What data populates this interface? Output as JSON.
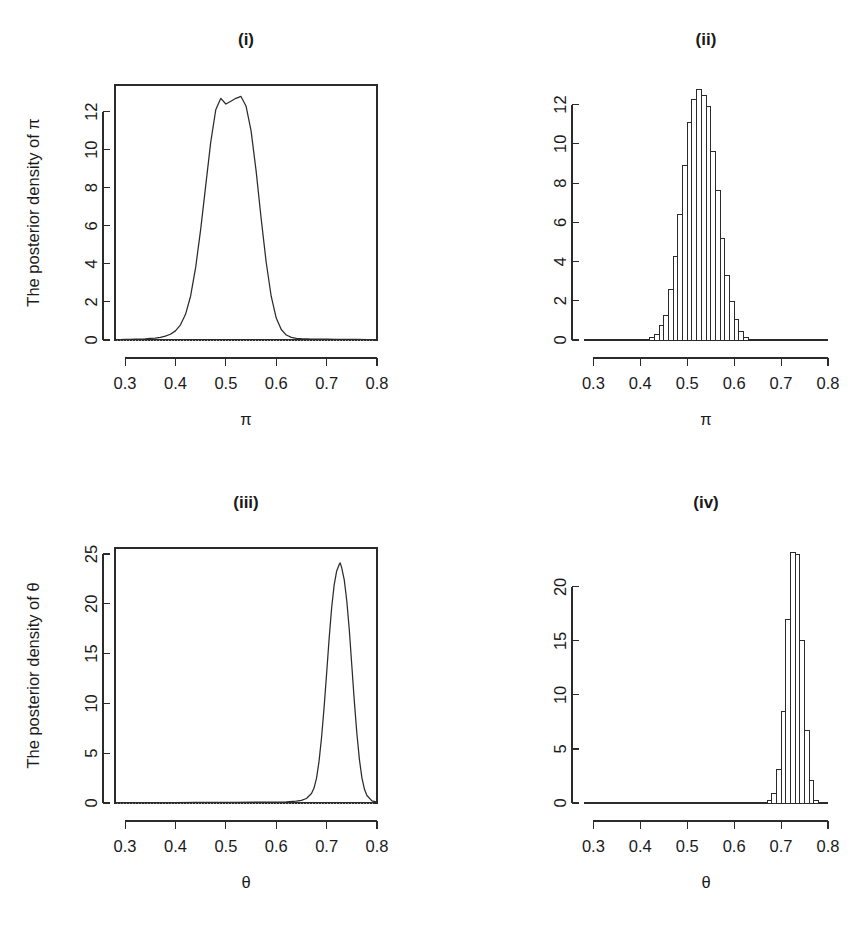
{
  "figure": {
    "width": 867,
    "height": 926,
    "background": "#ffffff",
    "ink_color": "#2b2b2b",
    "panel_count": 4
  },
  "chart_data": [
    {
      "id": "panel-i",
      "type": "line",
      "title": "(i)",
      "xlabel": "π",
      "ylabel": "The posterior density of  π",
      "xlim": [
        0.28,
        0.8
      ],
      "ylim": [
        0,
        13.4
      ],
      "xticks": [
        0.3,
        0.4,
        0.5,
        0.6,
        0.7,
        0.8
      ],
      "xtick_labels": [
        "0.3",
        "0.4",
        "0.5",
        "0.6",
        "0.7",
        "0.8"
      ],
      "yticks": [
        0,
        2,
        4,
        6,
        8,
        10,
        12
      ],
      "ytick_labels": [
        "0",
        "2",
        "4",
        "6",
        "8",
        "10",
        "12"
      ],
      "grid": false,
      "legend": null,
      "box": true,
      "zero_reference_line": true,
      "peak_x": 0.53,
      "peak_y": 12.8,
      "x": [
        0.28,
        0.29,
        0.3,
        0.31,
        0.32,
        0.33,
        0.34,
        0.35,
        0.36,
        0.37,
        0.38,
        0.39,
        0.4,
        0.41,
        0.42,
        0.43,
        0.44,
        0.45,
        0.46,
        0.47,
        0.48,
        0.49,
        0.5,
        0.51,
        0.52,
        0.53,
        0.54,
        0.55,
        0.56,
        0.57,
        0.58,
        0.59,
        0.6,
        0.61,
        0.62,
        0.63,
        0.64,
        0.65,
        0.66,
        0.67,
        0.68,
        0.69,
        0.7,
        0.72,
        0.74,
        0.76,
        0.78,
        0.8
      ],
      "y": [
        0.02,
        0.02,
        0.03,
        0.03,
        0.04,
        0.05,
        0.06,
        0.08,
        0.1,
        0.14,
        0.2,
        0.3,
        0.48,
        0.8,
        1.35,
        2.3,
        3.8,
        5.8,
        8.1,
        10.4,
        12.1,
        12.7,
        12.4,
        12.55,
        12.7,
        12.8,
        12.3,
        11.0,
        8.9,
        6.4,
        4.1,
        2.3,
        1.15,
        0.55,
        0.26,
        0.14,
        0.09,
        0.07,
        0.06,
        0.05,
        0.05,
        0.04,
        0.04,
        0.03,
        0.03,
        0.03,
        0.02,
        0.02
      ]
    },
    {
      "id": "panel-ii",
      "type": "bar",
      "title": "(ii)",
      "xlabel": "π",
      "ylabel": "",
      "xlim": [
        0.28,
        0.8
      ],
      "ylim": [
        0,
        13.0
      ],
      "xticks": [
        0.3,
        0.4,
        0.5,
        0.6,
        0.7,
        0.8
      ],
      "xtick_labels": [
        "0.3",
        "0.4",
        "0.5",
        "0.6",
        "0.7",
        "0.8"
      ],
      "yticks": [
        0,
        2,
        4,
        6,
        8,
        10,
        12
      ],
      "ytick_labels": [
        "0",
        "2",
        "4",
        "6",
        "8",
        "10",
        "12"
      ],
      "grid": false,
      "legend": null,
      "box": false,
      "bin_width": 0.01,
      "bin_starts": [
        0.42,
        0.43,
        0.44,
        0.45,
        0.46,
        0.47,
        0.48,
        0.49,
        0.5,
        0.51,
        0.52,
        0.53,
        0.54,
        0.55,
        0.56,
        0.57,
        0.58,
        0.59,
        0.6,
        0.61,
        0.62
      ],
      "values": [
        0.15,
        0.3,
        0.75,
        1.25,
        2.6,
        4.25,
        6.4,
        8.9,
        11.1,
        12.25,
        12.75,
        12.45,
        11.9,
        9.6,
        7.6,
        5.2,
        3.3,
        1.95,
        1.05,
        0.45,
        0.15
      ]
    },
    {
      "id": "panel-iii",
      "type": "line",
      "title": "(iii)",
      "xlabel": "θ",
      "ylabel": "The posterior density of  θ",
      "xlim": [
        0.28,
        0.8
      ],
      "ylim": [
        0,
        25.6
      ],
      "xticks": [
        0.3,
        0.4,
        0.5,
        0.6,
        0.7,
        0.8
      ],
      "xtick_labels": [
        "0.3",
        "0.4",
        "0.5",
        "0.6",
        "0.7",
        "0.8"
      ],
      "yticks": [
        0,
        5,
        10,
        15,
        20,
        25
      ],
      "ytick_labels": [
        "0",
        "5",
        "10",
        "15",
        "20",
        "25"
      ],
      "grid": false,
      "legend": null,
      "box": true,
      "zero_reference_line": true,
      "peak_x": 0.727,
      "peak_y": 24.1,
      "x": [
        0.28,
        0.32,
        0.36,
        0.4,
        0.44,
        0.48,
        0.52,
        0.56,
        0.6,
        0.62,
        0.64,
        0.65,
        0.66,
        0.67,
        0.675,
        0.68,
        0.685,
        0.69,
        0.695,
        0.7,
        0.705,
        0.71,
        0.715,
        0.72,
        0.725,
        0.727,
        0.73,
        0.735,
        0.74,
        0.745,
        0.75,
        0.755,
        0.76,
        0.765,
        0.77,
        0.775,
        0.78,
        0.79,
        0.8
      ],
      "y": [
        0.04,
        0.04,
        0.05,
        0.05,
        0.06,
        0.06,
        0.07,
        0.08,
        0.1,
        0.12,
        0.18,
        0.26,
        0.45,
        0.95,
        1.5,
        2.5,
        4.2,
        6.6,
        9.6,
        13.0,
        16.5,
        19.6,
        21.9,
        23.3,
        23.95,
        24.1,
        23.6,
        22.4,
        20.3,
        17.4,
        13.8,
        10.2,
        7.0,
        4.4,
        2.55,
        1.4,
        0.75,
        0.22,
        0.08
      ]
    },
    {
      "id": "panel-iv",
      "type": "bar",
      "title": "(iv)",
      "xlabel": "θ",
      "ylabel": "",
      "xlim": [
        0.28,
        0.8
      ],
      "ylim": [
        0,
        23.6
      ],
      "xticks": [
        0.3,
        0.4,
        0.5,
        0.6,
        0.7,
        0.8
      ],
      "xtick_labels": [
        "0.3",
        "0.4",
        "0.5",
        "0.6",
        "0.7",
        "0.8"
      ],
      "yticks": [
        0,
        5,
        10,
        15,
        20
      ],
      "ytick_labels": [
        "0",
        "5",
        "10",
        "15",
        "20"
      ],
      "grid": false,
      "legend": null,
      "box": false,
      "bin_width": 0.01,
      "bin_starts": [
        0.67,
        0.68,
        0.69,
        0.7,
        0.71,
        0.72,
        0.73,
        0.74,
        0.75,
        0.76,
        0.77
      ],
      "values": [
        0.2,
        0.9,
        3.1,
        8.5,
        17.0,
        23.2,
        23.0,
        15.0,
        6.7,
        2.1,
        0.25
      ]
    }
  ]
}
